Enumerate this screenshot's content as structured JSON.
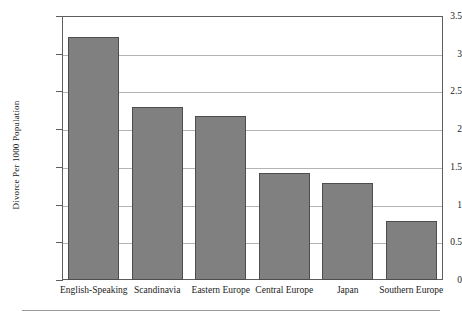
{
  "chart_data": {
    "type": "bar",
    "title": "",
    "xlabel": "",
    "ylabel": "Divorce Per 1000 Population",
    "categories": [
      "English-Speaking",
      "Scandinavia",
      "Eastern Europe",
      "Central Europe",
      "Japan",
      "Southern Europe"
    ],
    "values": [
      3.22,
      2.3,
      2.18,
      1.42,
      1.28,
      0.78
    ],
    "ylim": [
      0,
      3.5
    ],
    "yticks": [
      "0",
      "0.5",
      "1",
      "1.5",
      "2",
      "2.5",
      "3",
      "3.5"
    ],
    "ytick_values": [
      0,
      0.5,
      1,
      1.5,
      2,
      2.5,
      3,
      3.5
    ],
    "grid": true,
    "legend": "none",
    "bar_color": "#808080",
    "bar_edge_color": "#4d4d4d",
    "grid_color": "#b4b4b4",
    "frame_color": "#5e5e5e"
  }
}
